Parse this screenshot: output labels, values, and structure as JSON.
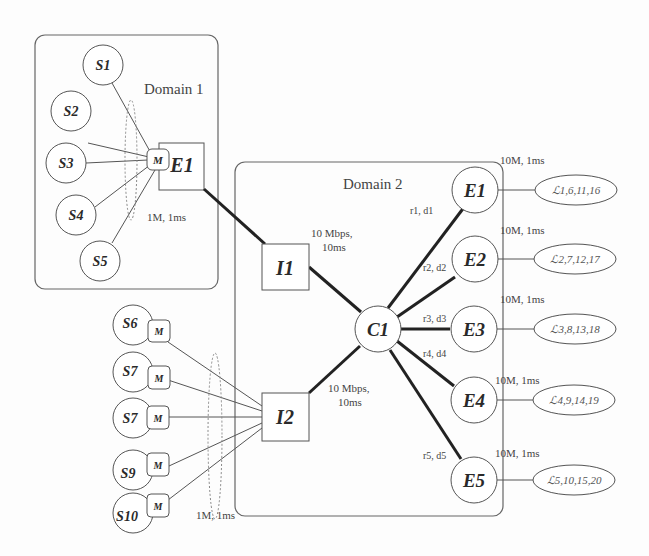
{
  "diagram": {
    "domains": [
      {
        "id": "domain1",
        "label": "Domain 1"
      },
      {
        "id": "domain2",
        "label": "Domain 2"
      }
    ],
    "domain1": {
      "sources": [
        {
          "id": "S1",
          "label": "S1"
        },
        {
          "id": "S2",
          "label": "S2"
        },
        {
          "id": "S3",
          "label": "S3"
        },
        {
          "id": "S4",
          "label": "S4"
        },
        {
          "id": "S5",
          "label": "S5"
        }
      ],
      "marker_label": "M",
      "edge_router_label": "E1",
      "access_link_label": "1M, 1ms"
    },
    "external_sources": [
      {
        "id": "S6",
        "label": "S6"
      },
      {
        "id": "S7a",
        "label": "S7"
      },
      {
        "id": "S7b",
        "label": "S7"
      },
      {
        "id": "S9",
        "label": "S9"
      },
      {
        "id": "S10",
        "label": "S10"
      }
    ],
    "external_marker_label": "M",
    "external_access_link_label": "1M, 1ms",
    "domain2": {
      "ingress": [
        {
          "id": "I1",
          "label": "I1",
          "link_label_line1": "10 Mbps,",
          "link_label_line2": "10ms"
        },
        {
          "id": "I2",
          "label": "I2",
          "link_label_line1": "10 Mbps,",
          "link_label_line2": "10ms"
        }
      ],
      "core_label": "C1",
      "egress": [
        {
          "id": "E1",
          "label": "E1",
          "core_link_label": "r1, d1",
          "out_link_label": "10M, 1ms",
          "sink_label": "ℒ1,6,11,16"
        },
        {
          "id": "E2",
          "label": "E2",
          "core_link_label": "r2, d2",
          "out_link_label": "10M, 1ms",
          "sink_label": "ℒ2,7,12,17"
        },
        {
          "id": "E3",
          "label": "E3",
          "core_link_label": "r3, d3",
          "out_link_label": "10M, 1ms",
          "sink_label": "ℒ3,8,13,18"
        },
        {
          "id": "E4",
          "label": "E4",
          "core_link_label": "r4, d4",
          "out_link_label": "10M, 1ms",
          "sink_label": "ℒ4,9,14,19"
        },
        {
          "id": "E5",
          "label": "E5",
          "core_link_label": "r5, d5",
          "out_link_label": "10M, 1ms",
          "sink_label": "ℒ5,10,15,20"
        }
      ]
    },
    "colors": {
      "stroke": "#555555",
      "thick_link": "#222222",
      "text": "#444444",
      "dotted": "#888888"
    }
  }
}
